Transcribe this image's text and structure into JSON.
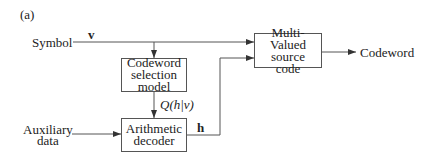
{
  "panel_label": "(a)",
  "inputs": {
    "symbol": "Symbol",
    "symbol_var": "v",
    "aux_line1": "Auxiliary",
    "aux_line2": "data"
  },
  "blocks": {
    "selection": [
      "Codeword",
      "selection",
      "model"
    ],
    "decoder": [
      "Arithmetic",
      "decoder"
    ],
    "source_code": [
      "Multi-Valued",
      "source",
      "code"
    ]
  },
  "signals": {
    "q_label": "Q(h|v)",
    "h_label": "h"
  },
  "output": "Codeword",
  "colors": {
    "line": "#555555",
    "text": "#222222"
  }
}
